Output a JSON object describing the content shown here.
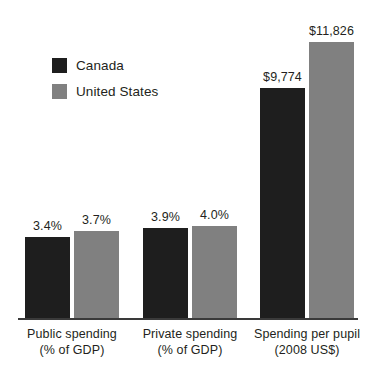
{
  "chart_data": {
    "type": "bar",
    "title": "",
    "subtitle": "",
    "xlabel": "",
    "ylabel": "",
    "grid": false,
    "legend_position": "upper-left",
    "categories": [
      "Public spending\n(% of GDP)",
      "Private spending\n(% of GDP)",
      "Spending per pupil\n(2008 US$)"
    ],
    "category_lines": [
      {
        "line1": "Public spending",
        "line2": "(% of GDP)"
      },
      {
        "line1": "Private spending",
        "line2": "(% of GDP)"
      },
      {
        "line1": "Spending per pupil",
        "line2": "(2008 US$)"
      }
    ],
    "series": [
      {
        "name": "Canada",
        "color": "#1e1e1e",
        "values": [
          3.4,
          3.9,
          9774
        ],
        "labels": [
          "3.4%",
          "3.9%",
          "$9,774"
        ]
      },
      {
        "name": "United States",
        "color": "#808080",
        "values": [
          3.7,
          4.0,
          11826
        ],
        "labels": [
          "3.7%",
          "4.0%",
          "$11,826"
        ]
      }
    ],
    "note": "Axes are not drawn to a shared numeric scale; percentage groups and dollar group use independent scaling."
  },
  "legend": {
    "items": [
      {
        "label": "Canada",
        "color": "#1e1e1e"
      },
      {
        "label": "United States",
        "color": "#808080"
      }
    ]
  },
  "bars": [
    {
      "group": 0,
      "series": "Canada",
      "label": "3.4%",
      "color": "#1e1e1e",
      "left": 25,
      "top": 237,
      "width": 45,
      "height": 81
    },
    {
      "group": 0,
      "series": "United States",
      "label": "3.7%",
      "color": "#808080",
      "left": 74,
      "top": 231,
      "width": 45,
      "height": 87
    },
    {
      "group": 1,
      "series": "Canada",
      "label": "3.9%",
      "color": "#1e1e1e",
      "left": 143,
      "top": 228,
      "width": 45,
      "height": 90
    },
    {
      "group": 1,
      "series": "United States",
      "label": "4.0%",
      "color": "#808080",
      "left": 192,
      "top": 226,
      "width": 45,
      "height": 92
    },
    {
      "group": 2,
      "series": "Canada",
      "label": "$9,774",
      "color": "#1e1e1e",
      "left": 260,
      "top": 88,
      "width": 45,
      "height": 230
    },
    {
      "group": 2,
      "series": "United States",
      "label": "$11,826",
      "color": "#808080",
      "left": 309,
      "top": 42,
      "width": 45,
      "height": 276
    }
  ],
  "axis": {
    "baseline_color": "#3a3a3a"
  }
}
